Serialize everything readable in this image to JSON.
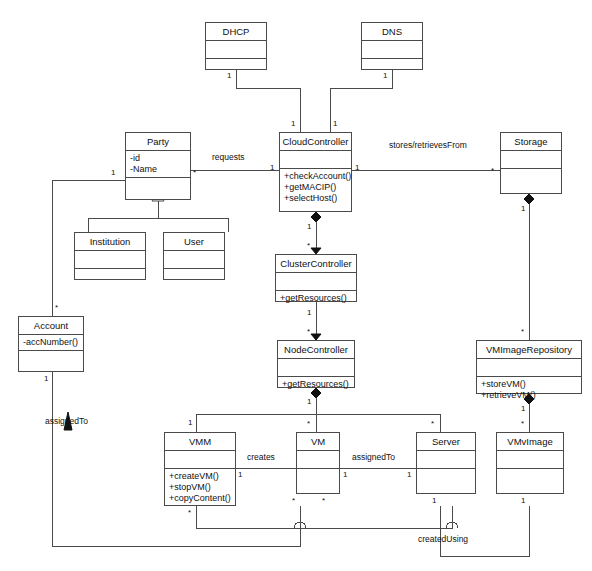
{
  "diagram": {
    "stroke_color": "#4a4a4a",
    "text_color": "#111111",
    "background": "#ffffff"
  },
  "classes": [
    {
      "id": "dhcp",
      "name": "DHCP",
      "attributes": [],
      "operations": []
    },
    {
      "id": "dns",
      "name": "DNS",
      "attributes": [],
      "operations": []
    },
    {
      "id": "party",
      "name": "Party",
      "attributes": [
        "-id",
        "-Name"
      ],
      "operations": []
    },
    {
      "id": "cloudcontroller",
      "name": "CloudController",
      "attributes": [],
      "operations": [
        "+checkAccount()",
        "+getMACIP()",
        "+selectHost()"
      ]
    },
    {
      "id": "storage",
      "name": "Storage",
      "attributes": [],
      "operations": []
    },
    {
      "id": "institution",
      "name": "Institution",
      "attributes": [],
      "operations": []
    },
    {
      "id": "user",
      "name": "User",
      "attributes": [],
      "operations": []
    },
    {
      "id": "clustercontroller",
      "name": "ClusterController",
      "attributes": [],
      "operations": [
        "+getResources()"
      ]
    },
    {
      "id": "account",
      "name": "Account",
      "attributes": [
        "-accNumber()"
      ],
      "operations": []
    },
    {
      "id": "nodecontroller",
      "name": "NodeController",
      "attributes": [],
      "operations": [
        "+getResources()"
      ]
    },
    {
      "id": "vmimagerepository",
      "name": "VMImageRepository",
      "attributes": [],
      "operations": [
        "+storeVM()",
        "+retrieveVM()"
      ]
    },
    {
      "id": "vmm",
      "name": "VMM",
      "attributes": [],
      "operations": [
        "+createVM()",
        "+stopVM()",
        "+copyContent()"
      ]
    },
    {
      "id": "vm",
      "name": "VM",
      "attributes": [],
      "operations": []
    },
    {
      "id": "server",
      "name": "Server",
      "attributes": [],
      "operations": []
    },
    {
      "id": "vmvimage",
      "name": "VMvImage",
      "attributes": [],
      "operations": []
    }
  ],
  "association_labels": {
    "requests": "requests",
    "stores_retrieves": "stores/retrievesFrom",
    "creates": "creates",
    "assigned_to_vm": "assignedTo",
    "assigned_to_account": "assignedTo",
    "created_using": "createdUsing"
  },
  "multiplicities": {
    "dhcp_bottom": "1",
    "dns_bottom": "1",
    "cc_top_left": "1",
    "cc_top_right": "1",
    "party_right": "*",
    "cc_left": "1",
    "cc_right": "1",
    "storage_left": "*",
    "party_left": "1",
    "account_top": "*",
    "cc_bottom": "1",
    "cluster_top": "*",
    "cluster_bottom": "1",
    "node_top": "*",
    "storage_bottom": "1",
    "repo_top": "*",
    "node_bottom": "1",
    "vmm_top": "1",
    "vm_top": "*",
    "server_top": "*",
    "vmvimage_top": "*",
    "vmm_right": "1",
    "vm_right_assigned": "1",
    "server_left": "1",
    "vmm_bottom": "*",
    "vm_bottom_left": "*",
    "vm_bottom_right": "*",
    "server_bottom": "1",
    "vmvimage_bottom": "1",
    "account_bottom": "1",
    "repo_bottom": "1"
  }
}
